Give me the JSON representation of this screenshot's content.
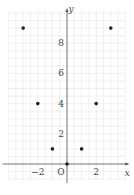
{
  "chart_data": {
    "type": "scatter",
    "title": "",
    "xlabel": "x",
    "ylabel": "y",
    "origin_label": "O",
    "x": [
      -3,
      -2,
      -1,
      0,
      1,
      2,
      3
    ],
    "y": [
      9,
      4,
      1,
      0,
      1,
      4,
      9
    ],
    "xlim": [
      -4,
      4
    ],
    "ylim": [
      -1,
      10
    ],
    "x_ticks": [
      {
        "value": -2,
        "label": "−2"
      },
      {
        "value": 2,
        "label": "2"
      }
    ],
    "y_ticks": [
      {
        "value": 2,
        "label": "2"
      },
      {
        "value": 4,
        "label": "4"
      },
      {
        "value": 6,
        "label": "6"
      },
      {
        "value": 8,
        "label": "8"
      }
    ],
    "grid": true,
    "grid_step": 0.5,
    "legend": null
  },
  "colors": {
    "grid": "#e6e6e6",
    "axis": "#555555",
    "point": "#222222",
    "text": "#444444"
  }
}
